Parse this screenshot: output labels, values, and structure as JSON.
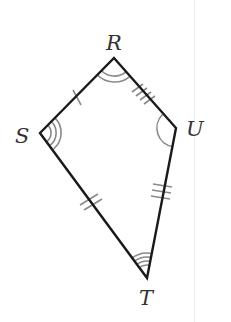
{
  "diagram": {
    "type": "kite",
    "vertices": [
      {
        "name": "R",
        "x": 114,
        "y": 58,
        "label_x": 108,
        "label_y": 50
      },
      {
        "name": "S",
        "x": 40,
        "y": 133,
        "label_x": 15,
        "label_y": 143
      },
      {
        "name": "U",
        "x": 176,
        "y": 128,
        "label_x": 187,
        "label_y": 136
      },
      {
        "name": "T",
        "x": 147,
        "y": 278,
        "label_x": 139,
        "label_y": 304
      }
    ],
    "sides": [
      {
        "from": "R",
        "to": "S",
        "tick_marks": 1
      },
      {
        "from": "R",
        "to": "U",
        "tick_marks": 4
      },
      {
        "from": "U",
        "to": "T",
        "tick_marks": 3
      },
      {
        "from": "S",
        "to": "T",
        "tick_marks": 2
      }
    ],
    "angles": [
      {
        "vertex": "R",
        "arcs": 2
      },
      {
        "vertex": "S",
        "arcs": 3
      },
      {
        "vertex": "U",
        "arcs": 1
      },
      {
        "vertex": "T",
        "arcs": 4
      }
    ],
    "colors": {
      "edge": "#1a1a1a",
      "marks": "#8a8a8a",
      "label": "#333333"
    }
  },
  "labels": {
    "R": "R",
    "S": "S",
    "U": "U",
    "T": "T"
  }
}
